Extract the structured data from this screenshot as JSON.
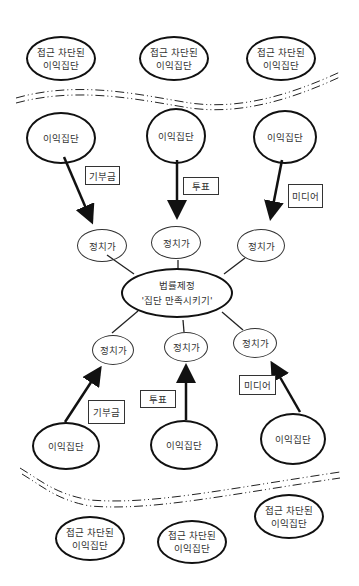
{
  "diagram": {
    "blocked_groups_top": [
      {
        "line1": "접근 차단된",
        "line2": "이익집단"
      },
      {
        "line1": "접근 차단된",
        "line2": "이익집단"
      },
      {
        "line1": "접근 차단된",
        "line2": "이익집단"
      }
    ],
    "interest_groups_top": [
      {
        "label": "이익집단"
      },
      {
        "label": "이익집단"
      },
      {
        "label": "이익집단"
      }
    ],
    "channels_top": [
      {
        "label": "기부금"
      },
      {
        "label": "투표"
      },
      {
        "label": "미디어"
      }
    ],
    "politicians_top": [
      {
        "label": "정치가"
      },
      {
        "label": "정치가"
      },
      {
        "label": "정치가"
      }
    ],
    "center": {
      "line1": "법률제정",
      "line2": "'집단 만족시키기'"
    },
    "politicians_bottom": [
      {
        "label": "정치가"
      },
      {
        "label": "정치가"
      },
      {
        "label": "정치가"
      }
    ],
    "channels_bottom": [
      {
        "label": "기부금"
      },
      {
        "label": "투표"
      },
      {
        "label": "미디어"
      }
    ],
    "interest_groups_bottom": [
      {
        "label": "이익집단"
      },
      {
        "label": "이익집단"
      },
      {
        "label": "이익집단"
      }
    ],
    "blocked_groups_bottom": [
      {
        "line1": "접근 차단된",
        "line2": "이익집단"
      },
      {
        "line1": "접근 차단된",
        "line2": "이익집단"
      },
      {
        "line1": "접근 차단된",
        "line2": "이익집단"
      }
    ]
  }
}
